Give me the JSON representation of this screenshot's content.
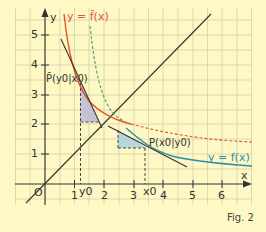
{
  "figure": {
    "caption": "Fig. 2",
    "axes": {
      "x_label": "x",
      "y_label": "y",
      "origin_label": "O",
      "x_ticks": [
        "1",
        "2",
        "3",
        "4",
        "5",
        "6"
      ],
      "y_ticks": [
        "1",
        "2",
        "3",
        "4",
        "5"
      ],
      "x_range": [
        -0.8,
        6.8
      ],
      "y_range": [
        -0.7,
        5.6
      ]
    },
    "curves": {
      "f": {
        "label": "y = f(x)",
        "color": "#2a8fa8"
      },
      "f_bar": {
        "label": "y = f̄(x)",
        "color": "#e8502e"
      },
      "mirror_line": {
        "label": "y = x",
        "color": "#333333"
      }
    },
    "points": {
      "P": {
        "label": "P(x0|y0)",
        "name": "P",
        "sub1": "0",
        "sub2": "0",
        "x": 3.4,
        "y": 1.2
      },
      "P_bar": {
        "label": "P̄(y0|x0)",
        "x": 1.2,
        "y": 3.4
      }
    },
    "axis_marks": {
      "x0": "x0",
      "y0": "y0"
    },
    "colors": {
      "background": "#fdf8c4",
      "grid": "#c9c7a4",
      "triangle_fill": "#b9b4d9",
      "triangle_fill_blue": "#a9d2df"
    }
  }
}
